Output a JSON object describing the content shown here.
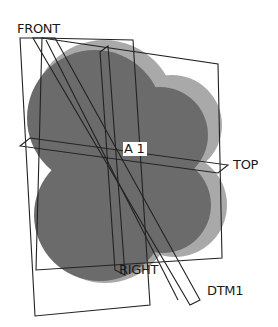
{
  "figure": {
    "colors": {
      "background": "#ffffff",
      "body_front": "#6b6b6b",
      "body_side": "#a9a9a9",
      "datum_lines": "#222222",
      "label_text": "#1a1a1a"
    },
    "datum_planes": [
      {
        "name": "FRONT"
      },
      {
        "name": "TOP"
      },
      {
        "name": "RIGHT"
      },
      {
        "name": "DTM1"
      }
    ],
    "datum_axis": {
      "name": "A_1",
      "display": "A  1"
    }
  }
}
